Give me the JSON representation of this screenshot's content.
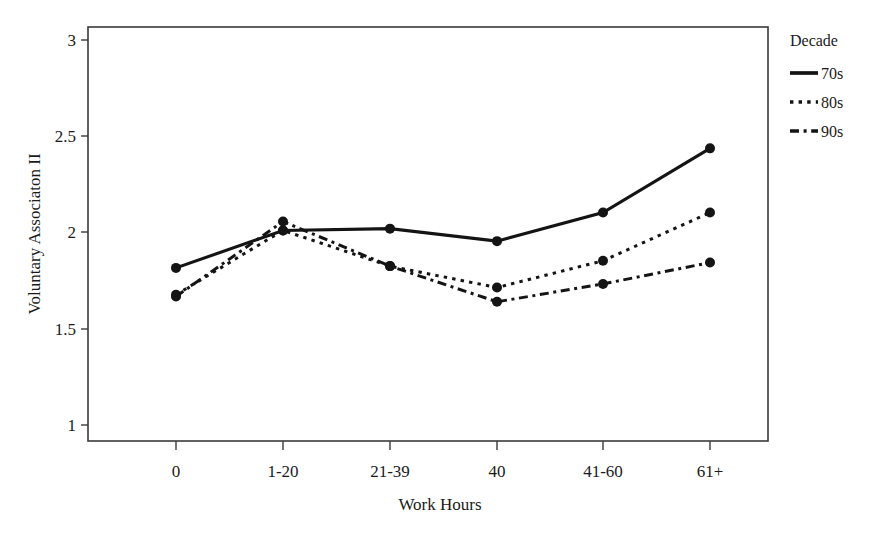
{
  "chart_data": {
    "type": "line",
    "title": "",
    "xlabel": "Work Hours",
    "ylabel": "Voluntary Associaton II",
    "categories": [
      "0",
      "1-20",
      "21-39",
      "40",
      "41-60",
      "61+"
    ],
    "ylim": [
      0.82,
      3.14
    ],
    "yticks": [
      "1",
      "1.5",
      "2",
      "2.5",
      "3"
    ],
    "ytick_values": [
      1,
      1.5,
      2,
      2.5,
      3
    ],
    "grid": false,
    "legend_position": "right",
    "legend_title": "Decade",
    "series": [
      {
        "name": "70s",
        "style": "solid",
        "values": [
          1.79,
          2.0,
          2.01,
          1.94,
          2.1,
          2.46
        ]
      },
      {
        "name": "80s",
        "style": "dotted",
        "values": [
          1.64,
          2.0,
          1.8,
          1.68,
          1.83,
          2.1
        ]
      },
      {
        "name": "90s",
        "style": "dash-dot",
        "values": [
          1.63,
          2.05,
          1.8,
          1.6,
          1.7,
          1.82
        ]
      }
    ]
  },
  "axes": {
    "y_label": "Voluntary Associaton II",
    "x_label": "Work Hours",
    "x_tick_labels": [
      "0",
      "1-20",
      "21-39",
      "40",
      "41-60",
      "61+"
    ],
    "y_tick_labels": [
      "1",
      "1.5",
      "2",
      "2.5",
      "3"
    ]
  },
  "legend": {
    "title": "Decade",
    "items": [
      {
        "label": "70s",
        "style": "solid"
      },
      {
        "label": "80s",
        "style": "dotted"
      },
      {
        "label": "90s",
        "style": "dash-dot"
      }
    ]
  },
  "colors": {
    "line": "#141414",
    "frame": "#3a3a3a",
    "text": "#1a1a1a",
    "background": "#ffffff"
  }
}
